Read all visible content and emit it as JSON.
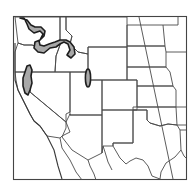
{
  "map": {
    "region": "Western United States",
    "type": "species range map",
    "colors": {
      "background": "#ffffff",
      "state_lines": "#4a4a4a",
      "range_fill": "#a8a8a8",
      "range_outline": "#1e1e1e"
    },
    "range_areas": [
      {
        "name": "Pacific Northwest / northern Rockies band"
      },
      {
        "name": "Northern California coastal ranges"
      },
      {
        "name": "Wasatch range, Utah"
      }
    ]
  }
}
